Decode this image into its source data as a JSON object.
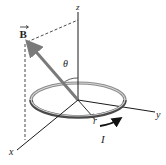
{
  "figure": {
    "labels": {
      "z_axis": "z",
      "y_axis": "y",
      "x_axis": "x",
      "field_vector": "B",
      "angle": "θ",
      "radius": "r",
      "current": "I"
    },
    "colors": {
      "axes": "#1a1a1a",
      "vector": "#7a7a7a",
      "ring_light": "#c8c8c8",
      "ring_dark": "#555555",
      "dashed": "#333333",
      "text": "#222222"
    }
  }
}
